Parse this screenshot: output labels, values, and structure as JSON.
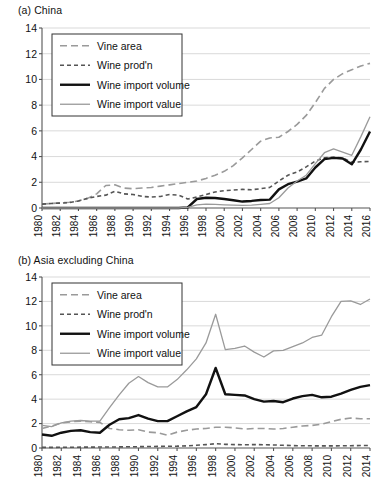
{
  "figure": {
    "panels": [
      {
        "id": "a",
        "title": "(a) China",
        "legend": [
          {
            "label": "Vine area",
            "key": "vine_area",
            "color": "#9a9a9a",
            "style": "long-dash",
            "width": 1.6
          },
          {
            "label": "Wine prod'n",
            "key": "wine_prodn",
            "color": "#555555",
            "style": "short-dash",
            "width": 1.6
          },
          {
            "label": "Wine import volume",
            "key": "wine_import_volume",
            "color": "#111111",
            "style": "solid",
            "width": 2.4
          },
          {
            "label": "Wine import value",
            "key": "wine_import_value",
            "color": "#9a9a9a",
            "style": "solid",
            "width": 1.3
          }
        ]
      },
      {
        "id": "b",
        "title": "(b) Asia excluding China",
        "legend": [
          {
            "label": "Vine area",
            "key": "vine_area",
            "color": "#9a9a9a",
            "style": "long-dash",
            "width": 1.6
          },
          {
            "label": "Wine prod'n",
            "key": "wine_prodn",
            "color": "#555555",
            "style": "short-dash",
            "width": 1.6
          },
          {
            "label": "Wine import volume",
            "key": "wine_import_volume",
            "color": "#111111",
            "style": "solid",
            "width": 2.4
          },
          {
            "label": "Wine import value",
            "key": "wine_import_value",
            "color": "#9a9a9a",
            "style": "solid",
            "width": 1.3
          }
        ]
      }
    ]
  },
  "chart_data": [
    {
      "type": "line",
      "title": "(a) China",
      "xlabel": "",
      "ylabel": "",
      "xlim": [
        1980,
        2016
      ],
      "ylim": [
        0,
        14
      ],
      "yticks": [
        0,
        2,
        4,
        6,
        8,
        10,
        12,
        14
      ],
      "xticks": [
        1980,
        1982,
        1984,
        1986,
        1988,
        1990,
        1992,
        1994,
        1996,
        1998,
        2000,
        2002,
        2004,
        2006,
        2008,
        2010,
        2012,
        2014,
        2016
      ],
      "grid": true,
      "legend_position": "upper-left",
      "x": [
        1980,
        1981,
        1982,
        1983,
        1984,
        1985,
        1986,
        1987,
        1988,
        1989,
        1990,
        1991,
        1992,
        1993,
        1994,
        1995,
        1996,
        1997,
        1998,
        1999,
        2000,
        2001,
        2002,
        2003,
        2004,
        2005,
        2006,
        2007,
        2008,
        2009,
        2010,
        2011,
        2012,
        2013,
        2014,
        2015,
        2016
      ],
      "series": [
        {
          "name": "Vine area",
          "key": "vine_area",
          "values": [
            0.3,
            0.35,
            0.4,
            0.45,
            0.55,
            0.75,
            1.1,
            1.75,
            1.8,
            1.55,
            1.5,
            1.55,
            1.6,
            1.7,
            1.8,
            1.9,
            2.0,
            2.1,
            2.3,
            2.55,
            2.85,
            3.3,
            3.9,
            4.55,
            5.2,
            5.45,
            5.5,
            5.95,
            6.5,
            7.2,
            8.2,
            9.3,
            10.0,
            10.45,
            10.75,
            11.05,
            11.25
          ]
        },
        {
          "name": "Wine prod'n",
          "key": "wine_prodn",
          "values": [
            0.3,
            0.35,
            0.38,
            0.42,
            0.55,
            0.75,
            0.9,
            1.0,
            1.3,
            1.1,
            1.05,
            0.9,
            0.85,
            0.9,
            1.05,
            1.0,
            0.7,
            0.85,
            1.05,
            1.25,
            1.35,
            1.4,
            1.45,
            1.42,
            1.5,
            1.6,
            2.1,
            2.55,
            2.8,
            3.2,
            3.65,
            3.9,
            3.95,
            3.9,
            3.55,
            3.6,
            3.62
          ]
        },
        {
          "name": "Wine import volume",
          "key": "wine_import_volume",
          "values": [
            0.0,
            0.0,
            0.0,
            0.0,
            0.0,
            0.0,
            0.0,
            0.0,
            0.0,
            0.0,
            0.0,
            0.0,
            0.0,
            0.0,
            0.0,
            0.0,
            0.05,
            0.7,
            0.8,
            0.78,
            0.7,
            0.6,
            0.5,
            0.55,
            0.62,
            0.65,
            1.45,
            1.85,
            2.05,
            2.3,
            3.15,
            3.8,
            3.9,
            3.85,
            3.4,
            4.55,
            5.95
          ]
        },
        {
          "name": "Wine import value",
          "key": "wine_import_value",
          "values": [
            0.0,
            0.0,
            0.0,
            0.0,
            0.0,
            0.0,
            0.0,
            0.0,
            0.0,
            0.0,
            0.0,
            0.0,
            0.0,
            0.0,
            0.0,
            0.0,
            0.05,
            0.25,
            0.3,
            0.28,
            0.25,
            0.22,
            0.2,
            0.22,
            0.28,
            0.35,
            0.8,
            1.55,
            2.1,
            2.55,
            3.45,
            4.3,
            4.6,
            4.35,
            4.1,
            5.55,
            7.1
          ]
        }
      ]
    },
    {
      "type": "line",
      "title": "(b) Asia excluding China",
      "xlabel": "",
      "ylabel": "",
      "xlim": [
        1980,
        2014
      ],
      "ylim": [
        0,
        14
      ],
      "yticks": [
        0,
        2,
        4,
        6,
        8,
        10,
        12,
        14
      ],
      "xticks": [
        1980,
        1982,
        1984,
        1986,
        1988,
        1990,
        1992,
        1994,
        1996,
        1998,
        2000,
        2002,
        2004,
        2006,
        2008,
        2010,
        2012,
        2014
      ],
      "grid": true,
      "legend_position": "upper-left",
      "x": [
        1980,
        1981,
        1982,
        1983,
        1984,
        1985,
        1986,
        1987,
        1988,
        1989,
        1990,
        1991,
        1992,
        1993,
        1994,
        1995,
        1996,
        1997,
        1998,
        1999,
        2000,
        2001,
        2002,
        2003,
        2004,
        2005,
        2006,
        2007,
        2008,
        2009,
        2010,
        2011,
        2012,
        2013,
        2014
      ],
      "series": [
        {
          "name": "Vine area",
          "key": "vine_area",
          "values": [
            1.6,
            1.8,
            2.05,
            2.15,
            2.2,
            2.15,
            2.1,
            1.6,
            1.5,
            1.45,
            1.5,
            1.3,
            1.25,
            1.05,
            1.3,
            1.45,
            1.55,
            1.6,
            1.7,
            1.7,
            1.65,
            1.55,
            1.6,
            1.6,
            1.55,
            1.6,
            1.7,
            1.8,
            1.85,
            1.95,
            2.15,
            2.35,
            2.45,
            2.4,
            2.4
          ]
        },
        {
          "name": "Wine prod'n",
          "key": "wine_prodn",
          "values": [
            0.05,
            0.05,
            0.06,
            0.06,
            0.07,
            0.07,
            0.08,
            0.08,
            0.09,
            0.1,
            0.11,
            0.12,
            0.13,
            0.14,
            0.15,
            0.18,
            0.22,
            0.28,
            0.35,
            0.3,
            0.28,
            0.26,
            0.28,
            0.27,
            0.25,
            0.22,
            0.2,
            0.18,
            0.18,
            0.17,
            0.17,
            0.18,
            0.19,
            0.2,
            0.2
          ]
        },
        {
          "name": "Wine import volume",
          "key": "wine_import_volume",
          "values": [
            1.1,
            1.0,
            1.25,
            1.4,
            1.45,
            1.3,
            1.25,
            1.9,
            2.35,
            2.45,
            2.7,
            2.4,
            2.2,
            2.2,
            2.6,
            3.0,
            3.35,
            4.4,
            6.55,
            4.4,
            4.35,
            4.3,
            4.0,
            3.8,
            3.85,
            3.75,
            4.05,
            4.25,
            4.35,
            4.15,
            4.2,
            4.45,
            4.75,
            5.0,
            5.15
          ]
        },
        {
          "name": "Wine import value",
          "key": "wine_import_value",
          "values": [
            1.85,
            1.75,
            2.05,
            2.2,
            2.25,
            2.2,
            2.2,
            3.3,
            4.35,
            5.3,
            5.85,
            5.35,
            5.0,
            5.0,
            5.6,
            6.4,
            7.3,
            8.6,
            10.95,
            8.05,
            8.15,
            8.35,
            7.85,
            7.45,
            7.95,
            8.0,
            8.3,
            8.6,
            9.05,
            9.25,
            10.75,
            12.0,
            12.05,
            11.75,
            12.2
          ]
        }
      ]
    }
  ]
}
